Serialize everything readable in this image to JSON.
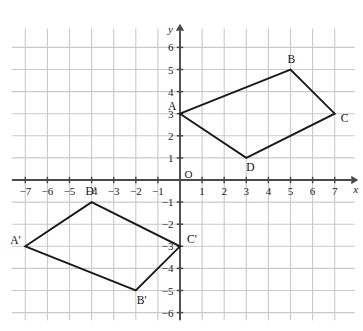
{
  "figure": {
    "background_color": "#ffffff",
    "grid_color": "#c9c9c9",
    "axis_color": "#4a4a4a",
    "shape_color": "#1a1a1a"
  },
  "axes": {
    "x_name": "x",
    "y_name": "y",
    "origin_label": "O",
    "x_ticks": [
      "-7",
      "-6",
      "-5",
      "-4",
      "-3",
      "-2",
      "-1",
      "1",
      "2",
      "3",
      "4",
      "5",
      "6",
      "7"
    ],
    "y_ticks": [
      "6",
      "5",
      "4",
      "3",
      "2",
      "1",
      "-1",
      "-2",
      "-3",
      "-4",
      "-5",
      "-6"
    ],
    "x_range": [
      -7.8,
      8.0
    ],
    "y_range": [
      -6.6,
      6.9
    ],
    "grid_on": true
  },
  "chart_data": {
    "type": "scatter",
    "xlabel": "x",
    "ylabel": "y",
    "xlim": [
      -7.8,
      8.0
    ],
    "ylim": [
      -6.6,
      6.9
    ],
    "grid": true,
    "legend": "none",
    "series": [
      {
        "name": "ABCD",
        "closed": true,
        "points": [
          {
            "label": "A",
            "x": 0,
            "y": 3,
            "label_dx": -12,
            "label_dy": -4
          },
          {
            "label": "B",
            "x": 5,
            "y": 5,
            "label_dx": -3,
            "label_dy": -7
          },
          {
            "label": "C",
            "x": 7,
            "y": 3,
            "label_dx": 6,
            "label_dy": 8
          },
          {
            "label": "D",
            "x": 3,
            "y": 1,
            "label_dx": 0,
            "label_dy": 13
          }
        ]
      },
      {
        "name": "A'B'C'D'",
        "closed": true,
        "points": [
          {
            "label": "A'",
            "x": -7,
            "y": -3,
            "label_dx": -15,
            "label_dy": -2
          },
          {
            "label": "B'",
            "x": -2,
            "y": -5,
            "label_dx": 1,
            "label_dy": 13
          },
          {
            "label": "C'",
            "x": 0,
            "y": -3,
            "label_dx": 7,
            "label_dy": -3
          },
          {
            "label": "D'",
            "x": -4,
            "y": -1,
            "label_dx": -6,
            "label_dy": -7
          }
        ]
      }
    ]
  }
}
